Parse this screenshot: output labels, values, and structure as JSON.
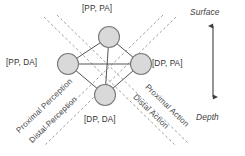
{
  "figure": {
    "background_color": "#ffffff",
    "nodes": [
      {
        "id": "top",
        "label": "[PP, PA]",
        "x": 109,
        "y": 37,
        "r": 10.5
      },
      {
        "id": "left",
        "label": "[PP, DA]",
        "x": 68,
        "y": 64,
        "r": 10.5
      },
      {
        "id": "right",
        "label": "[DP, PA]",
        "x": 141,
        "y": 64,
        "r": 10.5
      },
      {
        "id": "bottom",
        "label": "[DP, DA]",
        "x": 105,
        "y": 95,
        "r": 10.5
      }
    ],
    "node_fill": "#d9d9d9",
    "node_stroke": "#7a7a7a",
    "edge_color": "#555555",
    "dashed_color": "#8c8c8c",
    "axis": {
      "top_label": "Surface",
      "bottom_label": "Depth",
      "arrow_color": "#3f3f3f"
    },
    "diagonals": [
      {
        "id": "proximal-perception",
        "label": "Proximal Perception"
      },
      {
        "id": "distal-perception",
        "label": "Distal Perception"
      },
      {
        "id": "proximal-action",
        "label": "Proximal Action"
      },
      {
        "id": "distal-action",
        "label": "Distal Action"
      }
    ]
  }
}
